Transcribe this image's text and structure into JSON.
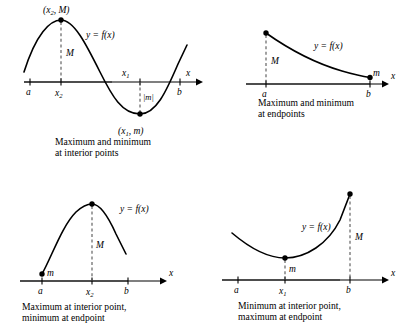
{
  "figure": {
    "colors": {
      "curve": "#000000",
      "axis": "#000000",
      "axis_highlight": "#9a9a9a",
      "dashed": "#555555",
      "point": "#000000",
      "background": "#ffffff"
    }
  },
  "panels": [
    {
      "id": "top-left",
      "caption": "Maximum and minimum\nat interior points",
      "axis_label": "x",
      "function_label": "y = f(x)",
      "tick_labels": [
        "a",
        "x",
        "x",
        "b"
      ],
      "labels": {
        "max_point": "(x2, M)",
        "max_point_base": "(x",
        "max_point_sub": "2",
        "max_point_rest": ", M)",
        "min_point_base": "(x",
        "min_point_sub": "1",
        "min_point_rest": ", m)",
        "max_height": "M",
        "min_depth": "|m|",
        "tick_a": "a",
        "tick_x2_base": "x",
        "tick_x2_sub": "2",
        "tick_x1_base": "x",
        "tick_x1_sub": "1",
        "tick_b": "b"
      }
    },
    {
      "id": "top-right",
      "caption": "Maximum and minimum\nat endpoints",
      "axis_label": "x",
      "function_label": "y = f(x)",
      "labels": {
        "max_height": "M",
        "min_marker": "m",
        "tick_a": "a",
        "tick_b": "b"
      }
    },
    {
      "id": "bottom-left",
      "caption": "Maximum at interior point,\nminimum at endpoint",
      "axis_label": "x",
      "function_label": "y = f(x)",
      "labels": {
        "max_height": "M",
        "min_marker": "m",
        "tick_a": "a",
        "tick_x2_base": "x",
        "tick_x2_sub": "2",
        "tick_b": "b"
      }
    },
    {
      "id": "bottom-right",
      "caption": "Minimum at interior point,\nmaximum at endpoint",
      "axis_label": "x",
      "function_label": "y = f(x)",
      "labels": {
        "max_height": "M",
        "min_marker": "m",
        "tick_a": "a",
        "tick_x1_base": "x",
        "tick_x1_sub": "1",
        "tick_b": "b"
      }
    }
  ]
}
